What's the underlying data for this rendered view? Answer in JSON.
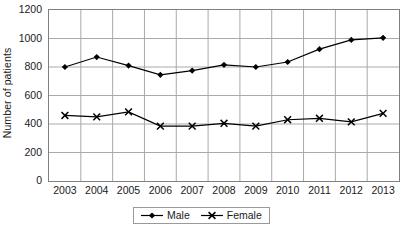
{
  "chart_data": {
    "type": "line",
    "title": "",
    "subtitle": "",
    "xlabel": "",
    "ylabel": "Number of patients",
    "x": [
      2003,
      2004,
      2005,
      2006,
      2007,
      2008,
      2009,
      2010,
      2011,
      2012,
      2013
    ],
    "categories": [
      "2003",
      "2004",
      "2005",
      "2006",
      "2007",
      "2008",
      "2009",
      "2010",
      "2011",
      "2012",
      "2013"
    ],
    "series": [
      {
        "name": "Male",
        "marker": "diamond",
        "color": "#000000",
        "values": [
          800,
          870,
          810,
          745,
          775,
          815,
          800,
          835,
          925,
          990,
          1005
        ]
      },
      {
        "name": "Female",
        "marker": "x",
        "color": "#000000",
        "values": [
          460,
          450,
          485,
          385,
          385,
          405,
          385,
          430,
          440,
          415,
          475
        ]
      }
    ],
    "ylim": [
      0,
      1200
    ],
    "y_ticks": [
      0,
      200,
      400,
      600,
      800,
      1000,
      1200
    ],
    "y_tick_labels": [
      "0",
      "200",
      "400",
      "600",
      "800",
      "1000",
      "1200"
    ],
    "xlim": [
      2002.5,
      2013.5
    ],
    "grid": {
      "horizontal": true,
      "vertical": true,
      "color": "#aaaaaa"
    },
    "legend": {
      "position": "bottom-center",
      "bordered": true,
      "entries": [
        "Male",
        "Female"
      ]
    },
    "plot_border_color": "#808080",
    "background": "#ffffff"
  }
}
